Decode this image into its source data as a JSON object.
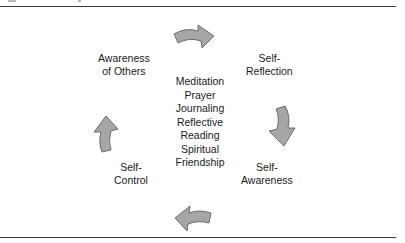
{
  "diagram": {
    "nodes": [
      {
        "id": "awareness-of-others",
        "lines": [
          "Awareness",
          "of Others"
        ]
      },
      {
        "id": "self-reflection",
        "lines": [
          "Self-",
          "Reflection"
        ]
      },
      {
        "id": "self-awareness",
        "lines": [
          "Self-",
          "Awareness"
        ]
      },
      {
        "id": "self-control",
        "lines": [
          "Self-",
          "Control"
        ]
      }
    ],
    "center_practices": [
      "Meditation",
      "Prayer",
      "Journaling",
      "Reflective",
      "Reading",
      "Spiritual",
      "Friendship"
    ],
    "arrows": [
      {
        "from": "awareness-of-others",
        "to": "self-reflection",
        "direction": "right"
      },
      {
        "from": "self-reflection",
        "to": "self-awareness",
        "direction": "down"
      },
      {
        "from": "self-awareness",
        "to": "self-control",
        "direction": "left"
      },
      {
        "from": "self-control",
        "to": "awareness-of-others",
        "direction": "up"
      }
    ],
    "arrow_fill": "#a6a6a6",
    "arrow_stroke": "#555555"
  }
}
